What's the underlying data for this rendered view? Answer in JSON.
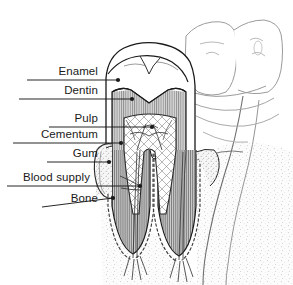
{
  "figure": {
    "background_color": "#ffffff",
    "width": 293,
    "height": 285
  },
  "labels": [
    {
      "id": "enamel",
      "text": "Enamel",
      "text_right_x": 98,
      "text_baseline_y": 76,
      "leader": {
        "x1": 27,
        "y1": 80,
        "x2": 118,
        "y2": 80,
        "dot_r": 2.1
      }
    },
    {
      "id": "dentin",
      "text": "Dentin",
      "text_right_x": 98,
      "text_baseline_y": 95,
      "leader": {
        "x1": 19,
        "y1": 99,
        "x2": 132,
        "y2": 99,
        "dot_r": 2.1
      }
    },
    {
      "id": "pulp",
      "text": "Pulp",
      "text_right_x": 98,
      "text_baseline_y": 123,
      "leader": {
        "x1": 49,
        "y1": 127,
        "x2": 152,
        "y2": 127,
        "dot_r": 2.1
      }
    },
    {
      "id": "cementum",
      "text": "Cementum",
      "text_right_x": 98,
      "text_baseline_y": 139,
      "leader": {
        "x1": 13,
        "y1": 143,
        "x2": 121,
        "y2": 143,
        "dot_r": 2.1
      }
    },
    {
      "id": "gum",
      "text": "Gum",
      "text_right_x": 98,
      "text_baseline_y": 158,
      "leader": {
        "x1": 47,
        "y1": 162,
        "x2": 109,
        "y2": 162,
        "dot_r": 2.1
      }
    },
    {
      "id": "blood-supply",
      "text": "Blood supply",
      "text_right_x": 90,
      "text_baseline_y": 182,
      "leader": {
        "x1": 7,
        "y1": 186,
        "x2": 140,
        "y2": 186,
        "dot_r": 2.1
      }
    },
    {
      "id": "bone",
      "text": "Bone",
      "text_right_x": 98,
      "text_baseline_y": 203,
      "leader": {
        "x1": 42,
        "y1": 207,
        "x2": 113,
        "y2": 198,
        "dot_r": 2.1
      }
    }
  ],
  "structures": [
    {
      "id": "enamel-cap",
      "name": "Enamel",
      "fill": "#ffffff",
      "stroke": "#1a1a1a"
    },
    {
      "id": "dentin-body",
      "name": "Dentin",
      "fill": "#9a9a9a",
      "stroke": "#1a1a1a"
    },
    {
      "id": "pulp-chamber",
      "name": "Pulp",
      "fill": "#ffffff",
      "stroke": "#333333"
    },
    {
      "id": "cementum-layer",
      "name": "Cementum",
      "fill": "#8f8f8f",
      "stroke": "#2a2a2a"
    },
    {
      "id": "gum-tissue",
      "name": "Gum",
      "fill": "#f2f2f2",
      "stroke": "#2a2a2a"
    },
    {
      "id": "blood-vessels",
      "name": "Blood supply",
      "fill": "none",
      "stroke": "#3a3a3a"
    },
    {
      "id": "bone-tissue",
      "name": "Bone",
      "fill": "#fbfbfb",
      "stroke": "#555555"
    },
    {
      "id": "adjacent-teeth",
      "name": "Adjacent teeth",
      "fill": "#ffffff",
      "stroke": "#9b9b9b"
    }
  ],
  "colors": {
    "ink": "#1a1a1a",
    "dentin_gray": "#9a9a9a",
    "bone_gray": "#bdbdbd",
    "light_outline": "#9b9b9b",
    "background": "#ffffff"
  }
}
